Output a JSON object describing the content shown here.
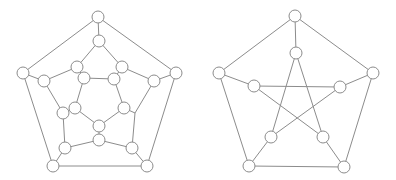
{
  "diagram": {
    "node_radius": 6,
    "stroke_color": "#8c8c8c",
    "fill_color": "#ffffff",
    "graphs": [
      {
        "name": "dodecahedral-graph",
        "nodes": [
          {
            "id": "o0",
            "x": 98,
            "y": 17,
            "visible": true
          },
          {
            "id": "o1",
            "x": 23,
            "y": 73,
            "visible": true
          },
          {
            "id": "o2",
            "x": 176,
            "y": 73,
            "visible": true
          },
          {
            "id": "o3",
            "x": 53,
            "y": 166,
            "visible": true
          },
          {
            "id": "o4",
            "x": 147,
            "y": 166,
            "visible": true
          },
          {
            "id": "a0",
            "x": 99,
            "y": 41,
            "visible": true
          },
          {
            "id": "a1",
            "x": 44,
            "y": 81,
            "visible": true
          },
          {
            "id": "a2",
            "x": 154,
            "y": 81,
            "visible": true
          },
          {
            "id": "a3",
            "x": 65,
            "y": 148,
            "visible": true
          },
          {
            "id": "a4",
            "x": 132,
            "y": 148,
            "visible": true
          },
          {
            "id": "b0",
            "x": 77,
            "y": 67,
            "visible": true
          },
          {
            "id": "b1",
            "x": 122,
            "y": 67,
            "visible": true
          },
          {
            "id": "b2",
            "x": 63,
            "y": 113,
            "visible": true
          },
          {
            "id": "b3",
            "x": 135,
            "y": 113,
            "visible": false
          },
          {
            "id": "b4",
            "x": 99,
            "y": 140,
            "visible": true
          },
          {
            "id": "c0",
            "x": 84,
            "y": 78,
            "visible": true
          },
          {
            "id": "c1",
            "x": 114,
            "y": 79,
            "visible": true
          },
          {
            "id": "c2",
            "x": 75,
            "y": 108,
            "visible": true
          },
          {
            "id": "c3",
            "x": 124,
            "y": 108,
            "visible": true
          },
          {
            "id": "c4",
            "x": 99,
            "y": 126,
            "visible": true
          }
        ],
        "edges": [
          [
            "o0",
            "o1"
          ],
          [
            "o0",
            "o2"
          ],
          [
            "o1",
            "o3"
          ],
          [
            "o2",
            "o4"
          ],
          [
            "o3",
            "o4"
          ],
          [
            "o0",
            "a0"
          ],
          [
            "o1",
            "a1"
          ],
          [
            "o2",
            "a2"
          ],
          [
            "o3",
            "a3"
          ],
          [
            "o4",
            "a4"
          ],
          [
            "a0",
            "b0"
          ],
          [
            "a0",
            "b1"
          ],
          [
            "a1",
            "b0"
          ],
          [
            "a1",
            "b2"
          ],
          [
            "a2",
            "b1"
          ],
          [
            "a2",
            "b3"
          ],
          [
            "a3",
            "b2"
          ],
          [
            "a3",
            "b4"
          ],
          [
            "a4",
            "b3"
          ],
          [
            "a4",
            "b4"
          ],
          [
            "b0",
            "c0"
          ],
          [
            "b1",
            "c1"
          ],
          [
            "b2",
            "c2"
          ],
          [
            "b3",
            "c3"
          ],
          [
            "b4",
            "c4"
          ],
          [
            "c0",
            "c1"
          ],
          [
            "c0",
            "c2"
          ],
          [
            "c1",
            "c3"
          ],
          [
            "c2",
            "c4"
          ],
          [
            "c3",
            "c4"
          ]
        ]
      },
      {
        "name": "petersen-graph",
        "nodes": [
          {
            "id": "p0",
            "x": 295,
            "y": 16,
            "visible": true
          },
          {
            "id": "p1",
            "x": 219,
            "y": 73,
            "visible": true
          },
          {
            "id": "p2",
            "x": 373,
            "y": 73,
            "visible": true
          },
          {
            "id": "p3",
            "x": 249,
            "y": 166,
            "visible": true
          },
          {
            "id": "p4",
            "x": 344,
            "y": 167,
            "visible": true
          },
          {
            "id": "q0",
            "x": 296,
            "y": 53,
            "visible": true
          },
          {
            "id": "q1",
            "x": 254,
            "y": 86,
            "visible": true
          },
          {
            "id": "q2",
            "x": 340,
            "y": 87,
            "visible": true
          },
          {
            "id": "q3",
            "x": 271,
            "y": 137,
            "visible": true
          },
          {
            "id": "q4",
            "x": 323,
            "y": 137,
            "visible": true
          }
        ],
        "edges": [
          [
            "p0",
            "p1"
          ],
          [
            "p0",
            "p2"
          ],
          [
            "p1",
            "p3"
          ],
          [
            "p2",
            "p4"
          ],
          [
            "p3",
            "p4"
          ],
          [
            "p0",
            "q0"
          ],
          [
            "p1",
            "q1"
          ],
          [
            "p2",
            "q2"
          ],
          [
            "p3",
            "q3"
          ],
          [
            "p4",
            "q4"
          ],
          [
            "q0",
            "q3"
          ],
          [
            "q0",
            "q4"
          ],
          [
            "q1",
            "q2"
          ],
          [
            "q1",
            "q4"
          ],
          [
            "q2",
            "q3"
          ]
        ]
      }
    ]
  }
}
